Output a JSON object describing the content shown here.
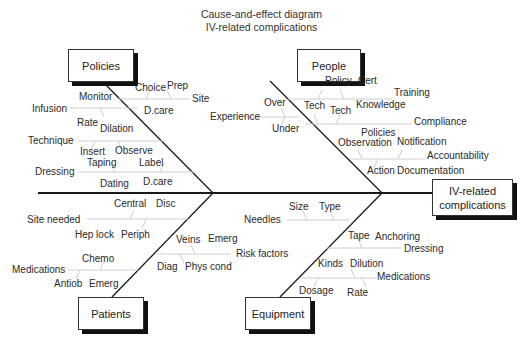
{
  "title": {
    "line1": "Cause-and-effect diagram",
    "line2": "IV-related complications"
  },
  "effect": {
    "label_line1": "IV-related",
    "label_line2": "complications"
  },
  "categories": {
    "policies": {
      "label": "Policies",
      "causes": [
        {
          "label": "Site",
          "subs": [
            "Choice",
            "Prep",
            "Monitor"
          ]
        },
        {
          "label": "Infusion",
          "subs": [
            "D.care",
            "Rate",
            "Dilation"
          ]
        },
        {
          "label": "Technique",
          "subs": [
            "Insert",
            "Observe"
          ]
        },
        {
          "label": "Dressing",
          "subs": [
            "Taping",
            "Label",
            "Dating",
            "D.care"
          ]
        }
      ]
    },
    "people": {
      "label": "People",
      "causes": [
        {
          "label": "Training",
          "subs": [
            "Policy",
            "Cert"
          ]
        },
        {
          "label": "Experience",
          "subs": [
            "Over",
            "Under"
          ]
        },
        {
          "label": "Compliance",
          "subs": [
            "Tech",
            "Tech",
            "Knowledge"
          ]
        },
        {
          "label": "Accountability",
          "subs": [
            "Policies",
            "Observation",
            "Notification",
            "Action",
            "Documentation"
          ]
        }
      ]
    },
    "patients": {
      "label": "Patients",
      "causes": [
        {
          "label": "Site needed",
          "subs": [
            "Central",
            "Disc",
            "Hep lock",
            "Periph"
          ]
        },
        {
          "label": "Risk factors",
          "subs": [
            "Veins",
            "Emerg",
            "Diag",
            "Phys cond"
          ]
        },
        {
          "label": "Medications",
          "subs": [
            "Chemo",
            "Antiob",
            "Emerg"
          ]
        }
      ]
    },
    "equipment": {
      "label": "Equipment",
      "causes": [
        {
          "label": "Needles",
          "subs": [
            "Size",
            "Type"
          ]
        },
        {
          "label": "Dressing",
          "subs": [
            "Tape",
            "Anchoring"
          ]
        },
        {
          "label": "Medications",
          "subs": [
            "Kinds",
            "Dilution",
            "Dosage",
            "Rate"
          ]
        }
      ]
    }
  },
  "colors": {
    "main_line": "#1a1a1a",
    "branch_line": "#cfcfcf",
    "shadow": "#111111"
  }
}
